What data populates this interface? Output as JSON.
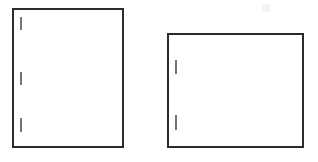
{
  "canvas": {
    "width": 318,
    "height": 162,
    "background_color": "#ffffff",
    "description": "Line drawing of two plain rectangles with short vertical tick marks on their left inner edges"
  },
  "style": {
    "stroke_color": "#2b2b2b",
    "stroke_width": 1.5,
    "tick_color": "#3a3a3a",
    "tick_width": 1.4,
    "fill_color": "#ffffff",
    "smudge_color": "#f2f2f2"
  },
  "shapes": [
    {
      "id": "rect-left",
      "name": "left-rectangle",
      "label": "Left rectangle",
      "x": 13,
      "y": 9,
      "width": 110,
      "height": 138,
      "fill": "none",
      "ticks": [
        {
          "id": "tick-left-1",
          "label": "Left rectangle tick 1",
          "x": 21,
          "y1": 17,
          "y2": 30
        },
        {
          "id": "tick-left-2",
          "label": "Left rectangle tick 2",
          "x": 21,
          "y1": 72,
          "y2": 85
        },
        {
          "id": "tick-left-3",
          "label": "Left rectangle tick 3",
          "x": 21,
          "y1": 118,
          "y2": 132
        }
      ]
    },
    {
      "id": "rect-right",
      "name": "right-rectangle",
      "label": "Right rectangle",
      "x": 168,
      "y": 34,
      "width": 135,
      "height": 113,
      "fill": "none",
      "ticks": [
        {
          "id": "tick-right-1",
          "label": "Right rectangle tick 1",
          "x": 176,
          "y1": 60,
          "y2": 74
        },
        {
          "id": "tick-right-2",
          "label": "Right rectangle tick 2",
          "x": 176,
          "y1": 115,
          "y2": 130
        }
      ]
    }
  ],
  "artifacts": [
    {
      "id": "smudge-top-right",
      "name": "faint-smudge",
      "label": "Faint smudge mark",
      "x": 262,
      "y": 4,
      "width": 9,
      "height": 8
    }
  ]
}
